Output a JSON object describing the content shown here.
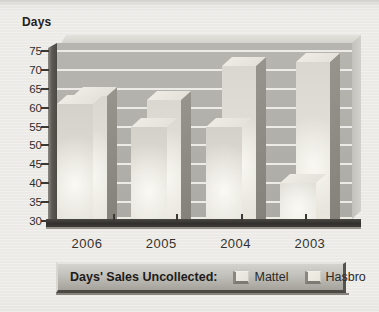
{
  "figure": {
    "axis_title": "Days"
  },
  "chart_data": {
    "type": "bar",
    "subtype": "3d-grouped-vertical",
    "title": "Days' Sales Uncollected",
    "ylabel": "Days",
    "xlabel": "",
    "categories": [
      "2006",
      "2005",
      "2004",
      "2003"
    ],
    "series": [
      {
        "name": "Mattel",
        "values": [
          61,
          55,
          55,
          40
        ]
      },
      {
        "name": "Hasbro",
        "values": [
          63,
          62,
          71,
          72
        ]
      }
    ],
    "ylim": [
      30,
      75
    ],
    "yticks": [
      75,
      70,
      65,
      60,
      55,
      50,
      45,
      40,
      35,
      30
    ],
    "grid": true,
    "legend_position": "bottom"
  },
  "legend": {
    "title": "Days' Sales Uncollected:",
    "items": [
      {
        "label": "Mattel",
        "swatch": "#e4e2db"
      },
      {
        "label": "Hasbro",
        "swatch": "#e9e6da"
      }
    ]
  },
  "colors": {
    "paper": "#eceae6",
    "wall": "#b1afaa",
    "gridline": "#f1f0ec",
    "axis_dark": "#33312d",
    "bar_front_mattel": "#dbd9d1",
    "bar_front_hasbro": "#e1dfd7",
    "bar_side": "#8d8a83",
    "bar_top": "#e9e7e0",
    "legend_face": "#c2c0ba",
    "text": "#2f2d2a"
  }
}
